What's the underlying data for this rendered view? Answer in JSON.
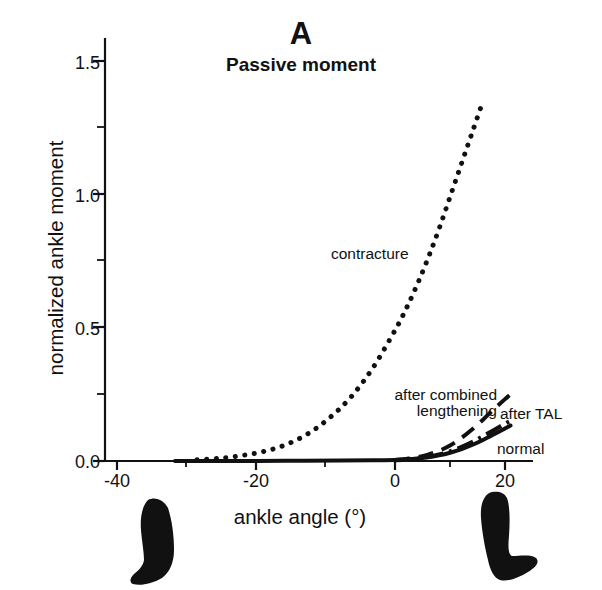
{
  "panel": {
    "label": "A",
    "subtitle": "Passive moment"
  },
  "axes": {
    "y_title": "normalized ankle moment",
    "x_title": "ankle angle (°)",
    "y_ticks": [
      "0.0",
      "0.5",
      "1.0",
      "1.5"
    ],
    "x_ticks": [
      "-40",
      "-20",
      "0",
      "20"
    ]
  },
  "annotations": {
    "contracture": "contracture",
    "after_combined_line1": "after combined",
    "after_combined_line2": "lengthening",
    "after_tal": "after TAL",
    "normal": "normal"
  },
  "icons": {
    "left_foot": "plantarflexed-foot-icon",
    "right_foot": "dorsiflexed-foot-icon"
  },
  "colors": {
    "ink": "#111111",
    "background": "#ffffff"
  },
  "chart_data": {
    "type": "line",
    "title": "Passive moment",
    "panel": "A",
    "xlabel": "ankle angle (°)",
    "ylabel": "normalized ankle moment",
    "xlim": [
      -42,
      24
    ],
    "ylim": [
      0.0,
      1.6
    ],
    "xticks": [
      -40,
      -20,
      0,
      20
    ],
    "yticks": [
      0.0,
      0.5,
      1.0,
      1.5
    ],
    "yticks_minor": [
      0.25,
      0.75,
      1.25
    ],
    "grid": false,
    "legend": "inline-annotations",
    "series": [
      {
        "name": "contracture",
        "style": "dotted",
        "x": [
          -36,
          -32,
          -28,
          -24,
          -20,
          -16,
          -12,
          -8,
          -4,
          0,
          2,
          4,
          6,
          8,
          10,
          12,
          14,
          16
        ],
        "y": [
          0.005,
          0.01,
          0.02,
          0.035,
          0.06,
          0.1,
          0.16,
          0.24,
          0.35,
          0.49,
          0.57,
          0.66,
          0.76,
          0.87,
          0.99,
          1.11,
          1.23,
          1.35
        ]
      },
      {
        "name": "after TAL",
        "style": "long-dashed",
        "x": [
          0,
          2,
          4,
          6,
          8,
          10,
          12,
          14,
          16,
          18,
          20,
          21
        ],
        "y": [
          0.004,
          0.008,
          0.014,
          0.024,
          0.038,
          0.058,
          0.085,
          0.118,
          0.155,
          0.195,
          0.232,
          0.25
        ]
      },
      {
        "name": "after combined lengthening",
        "style": "dash-dot",
        "x": [
          0,
          2,
          4,
          6,
          8,
          10,
          12,
          14,
          16,
          18,
          20,
          21
        ],
        "y": [
          0.003,
          0.005,
          0.009,
          0.015,
          0.024,
          0.036,
          0.052,
          0.071,
          0.093,
          0.116,
          0.14,
          0.15
        ]
      },
      {
        "name": "normal",
        "style": "solid",
        "x": [
          -40,
          -30,
          -20,
          -10,
          -4,
          0,
          2,
          4,
          6,
          8,
          10,
          12,
          14,
          16,
          18,
          20,
          21
        ],
        "y": [
          0.0,
          0.0,
          0.001,
          0.002,
          0.003,
          0.004,
          0.006,
          0.009,
          0.014,
          0.021,
          0.031,
          0.044,
          0.06,
          0.079,
          0.1,
          0.122,
          0.133
        ]
      }
    ]
  }
}
